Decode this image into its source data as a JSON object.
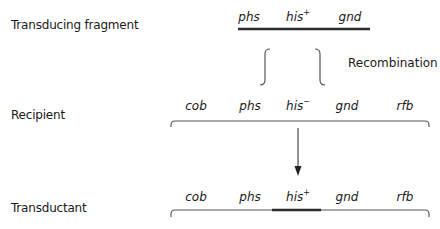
{
  "rows": {
    "fragment": {
      "label": "Transducing fragment",
      "genes": [
        {
          "name": "phs",
          "sup": ""
        },
        {
          "name": "his",
          "sup": "+"
        },
        {
          "name": "gnd",
          "sup": ""
        }
      ]
    },
    "recipient": {
      "label": "Recipient",
      "genes": [
        {
          "name": "cob",
          "sup": ""
        },
        {
          "name": "phs",
          "sup": ""
        },
        {
          "name": "his",
          "sup": "−"
        },
        {
          "name": "gnd",
          "sup": ""
        },
        {
          "name": "rfb",
          "sup": ""
        }
      ]
    },
    "transductant": {
      "label": "Transductant",
      "genes": [
        {
          "name": "cob",
          "sup": ""
        },
        {
          "name": "phs",
          "sup": ""
        },
        {
          "name": "his",
          "sup": "+"
        },
        {
          "name": "gnd",
          "sup": ""
        },
        {
          "name": "rfb",
          "sup": ""
        }
      ]
    }
  },
  "annotations": {
    "recombination": "Recombination"
  },
  "colors": {
    "text": "#1a1a1a",
    "thick_line": "#2b2b2b",
    "thin_line": "#555555"
  }
}
